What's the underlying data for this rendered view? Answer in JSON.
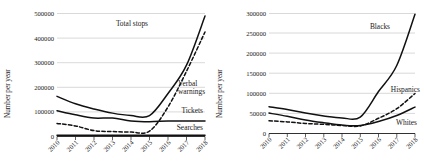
{
  "figure": {
    "panels": [
      {
        "name": "left-panel",
        "ylabel": "Number per year",
        "xlabel": "",
        "yticks": [
          "0",
          "100000",
          "200000",
          "300000",
          "400000",
          "500000"
        ],
        "xticks": [
          "2010",
          "2011",
          "2012",
          "2013",
          "2014",
          "2015",
          "2016",
          "2017",
          "2018"
        ],
        "labels": {
          "total_stops": "Total stops",
          "verbal_warnings_line1": "Verbal",
          "verbal_warnings_line2": "warnings",
          "tickets": "Tickets",
          "searches": "Searches"
        }
      },
      {
        "name": "right-panel",
        "ylabel": "Number per year",
        "xlabel": "",
        "yticks": [
          "0",
          "50000",
          "100000",
          "150000",
          "200000",
          "250000",
          "300000"
        ],
        "xticks": [
          "2010",
          "2011",
          "2012",
          "2013",
          "2014",
          "2015",
          "2016",
          "2017",
          "2018"
        ],
        "labels": {
          "blacks": "Blacks",
          "hispanics": "Hispanics",
          "whites": "Whites"
        }
      }
    ]
  },
  "chart_data": [
    {
      "type": "line",
      "title": "",
      "xlabel": "",
      "ylabel": "Number per year",
      "x": [
        2010,
        2011,
        2012,
        2013,
        2014,
        2015,
        2016,
        2017,
        2018
      ],
      "xlim": [
        2010,
        2018
      ],
      "ylim": [
        0,
        500000
      ],
      "yticks": [
        0,
        100000,
        200000,
        300000,
        400000,
        500000
      ],
      "grid": true,
      "legend_position": "inline-annotations",
      "series": [
        {
          "name": "Total stops",
          "style": "solid",
          "color": "#111111",
          "values": [
            163000,
            133000,
            112000,
            95000,
            85000,
            85000,
            175000,
            290000,
            490000
          ]
        },
        {
          "name": "Verbal warnings",
          "style": "dashed",
          "color": "#111111",
          "values": [
            53000,
            43000,
            24000,
            20000,
            18000,
            22000,
            120000,
            265000,
            425000
          ]
        },
        {
          "name": "Tickets",
          "style": "solid",
          "color": "#111111",
          "values": [
            105000,
            88000,
            75000,
            75000,
            63000,
            60000,
            63000,
            63000,
            63000
          ]
        },
        {
          "name": "Searches",
          "style": "solid",
          "color": "#111111",
          "values": [
            5000,
            5000,
            5000,
            5000,
            5000,
            5000,
            5000,
            5000,
            5000
          ]
        }
      ]
    },
    {
      "type": "line",
      "title": "",
      "xlabel": "",
      "ylabel": "Number per year",
      "x": [
        2010,
        2011,
        2012,
        2013,
        2014,
        2015,
        2016,
        2017,
        2018
      ],
      "xlim": [
        2010,
        2018
      ],
      "ylim": [
        0,
        300000
      ],
      "yticks": [
        0,
        50000,
        100000,
        150000,
        200000,
        250000,
        300000
      ],
      "grid": true,
      "legend_position": "inline-annotations",
      "series": [
        {
          "name": "Blacks",
          "style": "solid",
          "color": "#111111",
          "values": [
            67000,
            60000,
            51000,
            44000,
            39000,
            41000,
            105000,
            170000,
            298000
          ]
        },
        {
          "name": "Hispanics",
          "style": "dashed",
          "color": "#111111",
          "values": [
            32000,
            29000,
            25000,
            23000,
            20000,
            19000,
            38000,
            62000,
            100000
          ]
        },
        {
          "name": "Whites",
          "style": "solid",
          "color": "#111111",
          "values": [
            51000,
            43000,
            34000,
            27000,
            21000,
            20000,
            30000,
            45000,
            66000
          ]
        }
      ]
    }
  ]
}
